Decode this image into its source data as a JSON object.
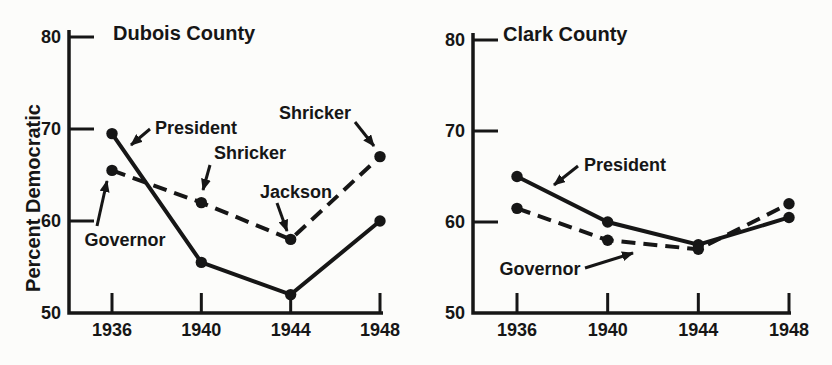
{
  "page": {
    "background": "#fcfcfa",
    "ink": "#161616"
  },
  "chart_data": [
    {
      "type": "line",
      "title": "Dubois County",
      "ylabel": "Percent Democratic",
      "xlabel": "",
      "x": [
        1936,
        1940,
        1944,
        1948
      ],
      "xtick_labels": [
        "1936",
        "1940",
        "1944",
        "1948"
      ],
      "yticks": [
        50,
        60,
        70,
        80
      ],
      "ytick_labels": [
        "50",
        "60",
        "70",
        "80"
      ],
      "ylim": [
        50,
        80
      ],
      "grid": false,
      "legend": "inline-annotations",
      "series": [
        {
          "name": "President",
          "line": "solid",
          "values": [
            69.5,
            55.5,
            52.0,
            60.0
          ]
        },
        {
          "name": "Governor",
          "line": "dashed",
          "values": [
            65.5,
            62.0,
            58.0,
            67.0
          ]
        }
      ],
      "annotations": [
        {
          "text": "President",
          "anchor": "start",
          "tx": 155,
          "ty": 134,
          "ax1": 150,
          "ay1": 129,
          "ax2": 131,
          "ay2": 145
        },
        {
          "text": "Governor",
          "anchor": "middle",
          "tx": 125,
          "ty": 246,
          "ax1": 97,
          "ay1": 226,
          "ax2": 107,
          "ay2": 181
        },
        {
          "text": "Shricker",
          "anchor": "middle",
          "tx": 250,
          "ty": 159,
          "ax1": 210,
          "ay1": 165,
          "ax2": 203,
          "ay2": 190
        },
        {
          "text": "Jackson",
          "anchor": "middle",
          "tx": 296,
          "ty": 198,
          "ax1": 277,
          "ay1": 203,
          "ax2": 287,
          "ay2": 231
        },
        {
          "text": "Shricker",
          "anchor": "middle",
          "tx": 315,
          "ty": 119,
          "ax1": 355,
          "ay1": 122,
          "ax2": 374,
          "ay2": 146
        }
      ]
    },
    {
      "type": "line",
      "title": "Clark County",
      "ylabel": "",
      "xlabel": "",
      "x": [
        1936,
        1940,
        1944,
        1948
      ],
      "xtick_labels": [
        "1936",
        "1940",
        "1944",
        "1948"
      ],
      "yticks": [
        50,
        60,
        70,
        80
      ],
      "ytick_labels": [
        "50",
        "60",
        "70",
        "80"
      ],
      "ylim": [
        50,
        80
      ],
      "grid": false,
      "legend": "inline-annotations",
      "series": [
        {
          "name": "President",
          "line": "solid",
          "values": [
            65.0,
            60.0,
            57.5,
            60.5
          ]
        },
        {
          "name": "Governor",
          "line": "dashed",
          "values": [
            61.5,
            58.0,
            57.0,
            62.0
          ]
        }
      ],
      "annotations": [
        {
          "text": "President",
          "anchor": "start",
          "tx": 584,
          "ty": 171,
          "ax1": 578,
          "ay1": 166,
          "ax2": 554,
          "ay2": 185
        },
        {
          "text": "Governor",
          "anchor": "middle",
          "tx": 540,
          "ty": 275,
          "ax1": 585,
          "ay1": 268,
          "ax2": 633,
          "ay2": 253
        }
      ]
    }
  ],
  "layout": {
    "width": 832,
    "height": 365,
    "charts": [
      {
        "axisX": 69,
        "baseY": 313,
        "topY": 37,
        "axisTopY": 30,
        "x0": 112,
        "x1": 380,
        "baseEndX": 383,
        "titleX": 113,
        "titleY": 40
      },
      {
        "axisX": 473,
        "baseY": 313,
        "topY": 40,
        "axisTopY": 33,
        "x0": 517,
        "x1": 789,
        "baseEndX": 791,
        "titleX": 503,
        "titleY": 41
      }
    ],
    "ylabelX": 40,
    "ylabelY": 198
  }
}
